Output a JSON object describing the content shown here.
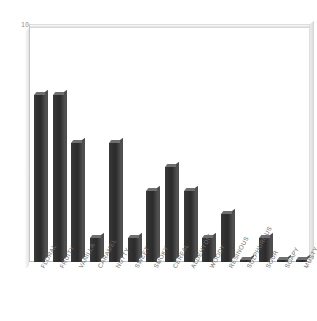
{
  "chart_data": {
    "type": "bar",
    "title": "",
    "subtitle": "",
    "xlabel": "",
    "ylabel": "",
    "ylim": [
      0,
      10
    ],
    "yticks": [
      0,
      1,
      2,
      3,
      4,
      5,
      6,
      7,
      8,
      9,
      10
    ],
    "ytick_labels": [
      "0",
      "1",
      "2",
      "3",
      "4",
      "5",
      "6",
      "7",
      "8",
      "9",
      "10"
    ],
    "grid": false,
    "legend": null,
    "bar_color": "#323232",
    "bar_top_color": "#6f6f6f",
    "frame_color": "#dddddd",
    "tick_label_color": "#8a8a8a",
    "categories": [
      "FLORAL",
      "FRUITY",
      "VANILLA",
      "CARAMEL",
      "NUTTY",
      "SWEET",
      "SMOKY",
      "CEREAL",
      "ALDEHYDIC",
      "WOODY",
      "RESINOUS",
      "SULPHUROUS",
      "SOUR",
      "SOAPY",
      "MUSTY"
    ],
    "values": [
      7,
      7,
      5,
      1,
      5,
      1,
      3,
      4,
      3,
      1,
      2,
      0.1,
      1,
      0.1,
      0.1
    ]
  }
}
